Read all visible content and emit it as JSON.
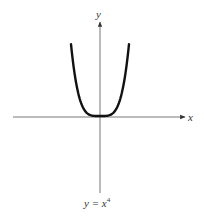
{
  "diagram": {
    "x_axis_label": "x",
    "y_axis_label": "y",
    "caption_lhs": "y = x",
    "caption_exponent": "4",
    "caption": "y = x^4",
    "curve_function": "y = x^4",
    "colors": {
      "curve": "#111111",
      "axes": "#555555",
      "text": "#333333",
      "background": "#ffffff"
    }
  },
  "chart_data": {
    "type": "line",
    "xlabel": "x",
    "ylabel": "y",
    "series": [
      {
        "name": "y = x^4",
        "x": [
          -1.3,
          -1.0,
          -0.5,
          0,
          0.5,
          1.0,
          1.3
        ],
        "values": [
          2.86,
          1.0,
          0.0625,
          0,
          0.0625,
          1.0,
          2.86
        ]
      }
    ],
    "grid": false,
    "ticks": false
  }
}
